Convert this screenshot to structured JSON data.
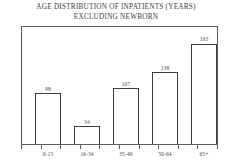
{
  "chart_data": {
    "type": "bar",
    "title": "AGE DISTRIBUTION OF INPATIENTS (YEARS) EXCLUDING NEWBORN",
    "title_lines": [
      "AGE DISTRIBUTION OF INPATIENTS (YEARS)",
      "EXCLUDING NEWBORN"
    ],
    "categories": [
      "0-15",
      "16-34",
      "35-49",
      "50-64",
      "65+"
    ],
    "values": [
      98,
      34,
      107,
      138,
      193
    ],
    "value_labels": [
      "98",
      "34",
      "107",
      "138",
      "193"
    ],
    "xlabel": "",
    "ylabel": "",
    "ylim": [
      0,
      225
    ],
    "grid": false,
    "legend": false,
    "bar_fill_color": "#ffffff",
    "bar_edge_color": "#3d3d3d",
    "frame_color": "#5b5b5b",
    "text_color": "#4a4a4a",
    "background_color": "#ffffff"
  }
}
